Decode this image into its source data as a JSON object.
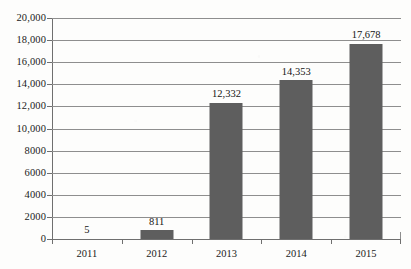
{
  "chart_data": {
    "type": "bar",
    "title": "",
    "subtitle": "",
    "xlabel": "",
    "ylabel": "",
    "categories": [
      "2011",
      "2012",
      "2013",
      "2014",
      "2015"
    ],
    "values": [
      5,
      811,
      12332,
      14353,
      17678
    ],
    "data_labels": [
      "5",
      "811",
      "12,332",
      "14,353",
      "17,678"
    ],
    "ylim": [
      0,
      20000
    ],
    "ytick_values": [
      0,
      2000,
      4000,
      6000,
      8000,
      10000,
      12000,
      14000,
      16000,
      18000,
      20000
    ],
    "ytick_labels": [
      "0",
      "2000",
      "4000",
      "6000",
      "8000",
      "10,000",
      "12,000",
      "14,000",
      "16,000",
      "18,000",
      "20,000"
    ],
    "grid": "horizontal",
    "legend": "none",
    "bar_color": "#5e5e5e",
    "gridline_color": "#8e8e8e",
    "axis_color": "#6f6f6f",
    "text_color": "#1b1b1b",
    "background_color": "#fdfdfc"
  }
}
